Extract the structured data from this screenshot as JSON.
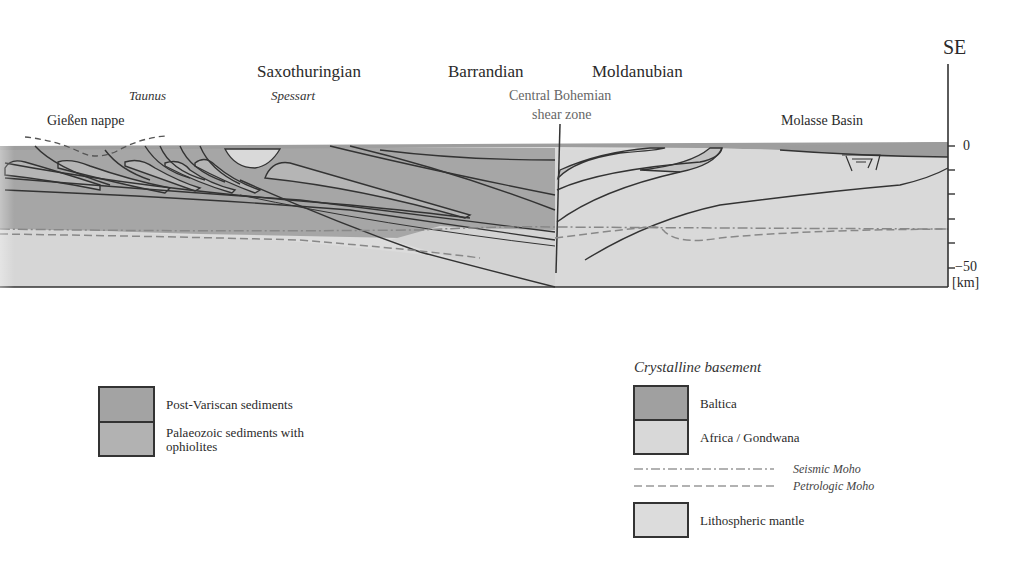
{
  "section": {
    "direction_label": "SE",
    "regions": [
      {
        "name": "Saxothuringian"
      },
      {
        "name": "Barrandian"
      },
      {
        "name": "Moldanubian"
      }
    ],
    "sublabels": [
      {
        "name": "Taunus"
      },
      {
        "name": "Spessart"
      }
    ],
    "features": {
      "giessen": "Gießen nappe",
      "shear_line1": "Central Bohemian",
      "shear_line2": "shear zone",
      "molasse": "Molasse Basin"
    },
    "axis": {
      "ticks": [
        "0",
        "",
        "",
        "",
        "",
        "−50"
      ],
      "unit": "[km]",
      "range_km": [
        0,
        -50
      ]
    },
    "colors": {
      "post_variscan": "#a3a3a3",
      "palaeozoic": "#b2b2b2",
      "baltica": "#a0a0a0",
      "africa_gondwana": "#d8d8d8",
      "mantle": "#dcdcdc",
      "line": "#333333",
      "moho": "#888888"
    }
  },
  "legend_left": {
    "items": [
      {
        "label": "Post-Variscan sediments"
      },
      {
        "label_line1": "Palaeozoic sediments with",
        "label_line2": "ophiolites"
      }
    ]
  },
  "legend_right": {
    "heading": "Crystalline  basement",
    "items": [
      {
        "label": "Baltica"
      },
      {
        "label": "Africa / Gondwana"
      }
    ],
    "lines": [
      {
        "label": "Seismic Moho",
        "style": "dash-dot"
      },
      {
        "label": "Petrologic Moho",
        "style": "dashed"
      }
    ],
    "mantle": {
      "label": "Lithospheric mantle"
    }
  }
}
